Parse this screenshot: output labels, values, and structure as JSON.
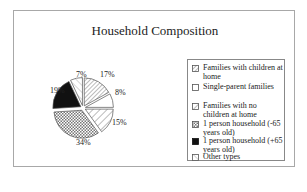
{
  "chart_data": {
    "type": "pie",
    "title": "Household Composition",
    "categories": [
      "Families with children at home",
      "Single-parent families",
      "Families with no children at home",
      "1 person household (-65 years old)",
      "1 person household (+65 years old)",
      "Other types"
    ],
    "values": [
      17,
      8,
      15,
      34,
      19,
      7
    ],
    "labels": [
      "17%",
      "8%",
      "15%",
      "34%",
      "19%",
      "7%"
    ],
    "patterns": [
      "fine-diagonal",
      "white",
      "wide-diagonal",
      "crosshatch",
      "black",
      "diagonal-light"
    ],
    "exploded": true,
    "legend_position": "right",
    "start_angle": "12 o'clock",
    "direction": "clockwise"
  },
  "legend": {
    "items": [
      {
        "label": "Families with children at home"
      },
      {
        "label": "Single-parent families"
      },
      {
        "label": "Families with no children at home"
      },
      {
        "label": "1 person household (-65 years old)"
      },
      {
        "label": "1 person household (+65 years old)"
      },
      {
        "label": "Other types"
      }
    ]
  }
}
